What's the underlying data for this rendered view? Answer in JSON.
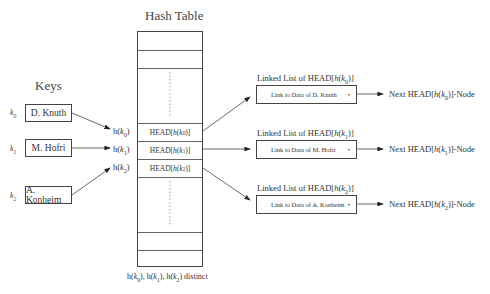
{
  "hash_table": {
    "title": "Hash Table",
    "slots": [
      "",
      "",
      "",
      "HEAD[h(k0)]",
      "HEAD[h(k1)]",
      "HEAD[h(k2)]",
      "",
      "",
      ""
    ],
    "caption": "h(k0), h(k1), h(k2) distinct"
  },
  "keys": {
    "title": "Keys",
    "items": [
      {
        "label": "k0",
        "name": "D. Knuth",
        "hash": "h(k0)"
      },
      {
        "label": "k1",
        "name": "M. Hofri",
        "hash": "h(k1)"
      },
      {
        "label": "k2",
        "name": "A. Konheim",
        "hash": "h(k2)"
      }
    ]
  },
  "linked_lists": [
    {
      "title": "Linked List of HEAD[h(k0)]",
      "node": "Link to Data of D. Knuth",
      "next": "Next HEAD[h(k0)]-Node"
    },
    {
      "title": "Linked List of HEAD[h(k1)]",
      "node": "Link to Data of M. Hofri",
      "next": "Next HEAD[h(k1)]-Node"
    },
    {
      "title": "Linked List of HEAD[h(k2)]",
      "node": "Link to Data of A. Konheim",
      "next": "Next HEAD[h(k2)]-Node"
    }
  ],
  "colors": {
    "line": "#444444",
    "text": "#333333"
  }
}
